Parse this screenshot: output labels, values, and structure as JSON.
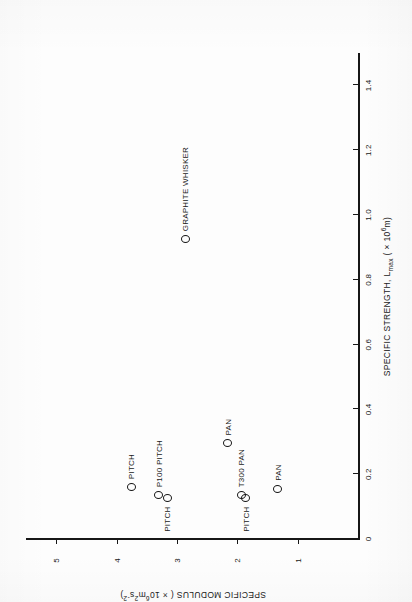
{
  "figure": {
    "rotation_note": "printed sideways",
    "background_color": "#fdfdfd",
    "ink_color": "#171717"
  },
  "chart_data": {
    "type": "scatter",
    "title": "",
    "xlabel_text": "SPECIFIC STRENGTH, L",
    "xlabel_sub": "max",
    "xlabel_unit_prefix": " ( × 10",
    "xlabel_unit_exp": "6",
    "xlabel_unit_suffix": "m)",
    "ylabel_text": "SPECIFIC MODULUS ( × 10",
    "ylabel_unit_exp": "6",
    "ylabel_unit_mid": "m",
    "ylabel_unit_exp2": "2",
    "ylabel_unit_mid2": "s",
    "ylabel_unit_exp3": "-2",
    "ylabel_unit_suffix": ")",
    "xlim": [
      0,
      1.5
    ],
    "ylim": [
      0,
      5.5
    ],
    "grid": false,
    "legend": "none",
    "xticks": [
      {
        "value": 0,
        "label": "0"
      },
      {
        "value": 0.2,
        "label": "0.2"
      },
      {
        "value": 0.4,
        "label": "0.4"
      },
      {
        "value": 0.6,
        "label": "0.6"
      },
      {
        "value": 0.8,
        "label": "0.8"
      },
      {
        "value": 1.0,
        "label": "1.0"
      },
      {
        "value": 1.2,
        "label": "1.2"
      },
      {
        "value": 1.4,
        "label": "1.4"
      }
    ],
    "yticks": [
      {
        "value": 1,
        "label": "1"
      },
      {
        "value": 2,
        "label": "2"
      },
      {
        "value": 3,
        "label": "3"
      },
      {
        "value": 4,
        "label": "4"
      },
      {
        "value": 5,
        "label": "5"
      }
    ],
    "points": [
      {
        "label": "PITCH",
        "x": 0.16,
        "y": 3.76,
        "label_side": "right"
      },
      {
        "label": "P100 PITCH",
        "x": 0.135,
        "y": 3.3,
        "label_side": "right"
      },
      {
        "label": "PITCH",
        "x": 0.125,
        "y": 3.16,
        "label_side": "left"
      },
      {
        "label": "PAN",
        "x": 0.295,
        "y": 2.16,
        "label_side": "right"
      },
      {
        "label": "T300 PAN",
        "x": 0.135,
        "y": 1.93,
        "label_side": "right"
      },
      {
        "label": "PITCH",
        "x": 0.125,
        "y": 1.86,
        "label_side": "left"
      },
      {
        "label": "PAN",
        "x": 0.155,
        "y": 1.33,
        "label_side": "right"
      },
      {
        "label": "GRAPHITE WHISKER",
        "x": 0.925,
        "y": 2.86,
        "label_side": "right"
      }
    ]
  }
}
